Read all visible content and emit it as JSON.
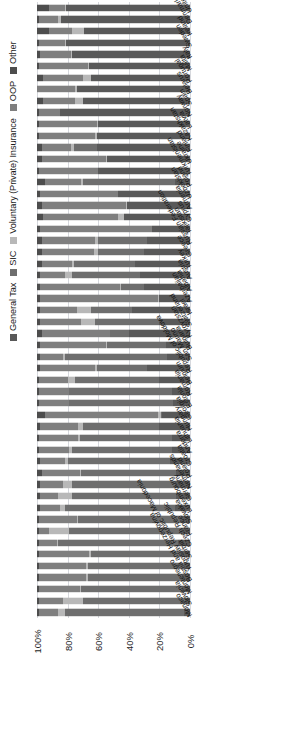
{
  "chart": {
    "type": "bar",
    "title": "",
    "xlabel": "",
    "ylabel": "",
    "orientation": "horizontal-stacked",
    "axis_reversed": true,
    "grid": true,
    "legend_position": "left-rotated"
  },
  "legend": {
    "items": [
      {
        "label": "General Tax",
        "color": "#595959",
        "icon": "square-swatch-icon"
      },
      {
        "label": "SIC",
        "color": "#6e6e6e",
        "icon": "square-swatch-icon"
      },
      {
        "label": "Voluntary (Private) Insurance",
        "color": "#b8b8b8",
        "icon": "square-swatch-icon"
      },
      {
        "label": "OOP",
        "color": "#7f7f7f",
        "icon": "square-swatch-icon"
      },
      {
        "label": "Other",
        "color": "#4d4d4d",
        "icon": "square-swatch-icon"
      }
    ]
  },
  "xaxis": {
    "ticks": [
      "100%",
      "80%",
      "60%",
      "40%",
      "20%",
      "0%"
    ],
    "tick_values": [
      100,
      80,
      60,
      40,
      20,
      0
    ],
    "min": 0,
    "max": 100
  },
  "chart_data": {
    "type": "bar",
    "subtype": "stacked-horizontal-100percent",
    "title": "",
    "xlabel": "",
    "ylabel": "",
    "xlim": [
      0,
      100
    ],
    "grid": true,
    "legend_position": "left",
    "series": [
      {
        "name": "General Tax",
        "color": "#595959"
      },
      {
        "name": "SIC",
        "color": "#6e6e6e"
      },
      {
        "name": "Voluntary (Private) Insurance",
        "color": "#b8b8b8"
      },
      {
        "name": "OOP",
        "color": "#7f7f7f"
      },
      {
        "name": "Other",
        "color": "#4d4d4d"
      }
    ],
    "categories": [
      "United Kingdom",
      "Denmark",
      "Ireland",
      "Sweden",
      "Italy",
      "Malta",
      "Portugal",
      "Belarus",
      "Spain",
      "Norway",
      "Latvia",
      "Kazakhstan",
      "Finland",
      "Ukraine",
      "Turkmenistan",
      "Poland",
      "Uzbekistan",
      "Armenia",
      "Cyprus",
      "Tajikistan",
      "Russian Federation",
      "Greece",
      "Turkey",
      "Austria",
      "Albania",
      "Azerbaijan",
      "Israel",
      "Switzerland",
      "Kyrgyzstan",
      "Bulgaria",
      "San Marino",
      "Republic of Moldova",
      "Belgium",
      "Romania",
      "Estonia",
      "Georgia",
      "Hungary",
      "Lithuania",
      "Andorra",
      "Croatia",
      "Poland",
      "Netherlands",
      "Germany",
      "Luxembourg",
      "Slovakia",
      "France",
      "Czech Republic",
      "Serbia",
      "Yugoslav Republic of Macedonia",
      "Bosnia and Herzegovina",
      "Montenegro",
      "Slovenia",
      "Monaco"
    ],
    "rows": [
      {
        "category": "United Kingdom",
        "values": [
          81,
          0,
          1,
          10,
          8
        ]
      },
      {
        "category": "Denmark",
        "values": [
          84,
          0,
          2,
          13,
          1
        ]
      },
      {
        "category": "Ireland",
        "values": [
          69,
          0,
          8,
          15,
          8
        ]
      },
      {
        "category": "Sweden",
        "values": [
          81,
          0,
          1,
          17,
          1
        ]
      },
      {
        "category": "Italy",
        "values": [
          77,
          0,
          1,
          20,
          2
        ]
      },
      {
        "category": "Malta",
        "values": [
          66,
          0,
          1,
          32,
          1
        ]
      },
      {
        "category": "Portugal",
        "values": [
          65,
          0,
          5,
          26,
          4
        ]
      },
      {
        "category": "Belarus",
        "values": [
          74,
          0,
          1,
          25,
          0
        ]
      },
      {
        "category": "Spain",
        "values": [
          70,
          0,
          5,
          21,
          4
        ]
      },
      {
        "category": "Norway",
        "values": [
          85,
          0,
          0,
          14,
          1
        ]
      },
      {
        "category": "Latvia",
        "values": [
          60,
          0,
          1,
          38,
          1
        ]
      },
      {
        "category": "Kazakhstan",
        "values": [
          61,
          0,
          1,
          37,
          1
        ]
      },
      {
        "category": "Finland",
        "values": [
          61,
          15,
          2,
          19,
          3
        ]
      },
      {
        "category": "Ukraine",
        "values": [
          54,
          0,
          1,
          42,
          3
        ]
      },
      {
        "category": "Turkmenistan",
        "values": [
          60,
          0,
          0,
          39,
          1
        ]
      },
      {
        "category": "Poland",
        "values": [
          10,
          60,
          1,
          24,
          5
        ]
      },
      {
        "category": "Uzbekistan",
        "values": [
          47,
          0,
          0,
          51,
          2
        ]
      },
      {
        "category": "Armenia",
        "values": [
          41,
          0,
          1,
          55,
          3
        ]
      },
      {
        "category": "Cyprus",
        "values": [
          43,
          0,
          4,
          49,
          4
        ]
      },
      {
        "category": "Tajikistan",
        "values": [
          25,
          0,
          0,
          73,
          2
        ]
      },
      {
        "category": "Russian Federation",
        "values": [
          28,
          32,
          2,
          35,
          3
        ]
      },
      {
        "category": "Greece",
        "values": [
          30,
          30,
          3,
          34,
          3
        ]
      },
      {
        "category": "Turkey",
        "values": [
          36,
          40,
          1,
          20,
          3
        ]
      },
      {
        "category": "Austria",
        "values": [
          33,
          44,
          5,
          16,
          2
        ]
      },
      {
        "category": "Albania",
        "values": [
          30,
          15,
          1,
          52,
          2
        ]
      },
      {
        "category": "Azerbaijan",
        "values": [
          20,
          0,
          1,
          77,
          2
        ]
      },
      {
        "category": "Israel",
        "values": [
          38,
          27,
          9,
          24,
          2
        ]
      },
      {
        "category": "Switzerland",
        "values": [
          20,
          42,
          9,
          27,
          2
        ]
      },
      {
        "category": "Kyrgyzstan",
        "values": [
          40,
          12,
          0,
          45,
          3
        ]
      },
      {
        "category": "Bulgaria",
        "values": [
          16,
          38,
          1,
          43,
          2
        ]
      },
      {
        "category": "San Marino",
        "values": [
          15,
          67,
          1,
          15,
          2
        ]
      },
      {
        "category": "Republic of Moldova",
        "values": [
          28,
          33,
          1,
          36,
          2
        ]
      },
      {
        "category": "Belgium",
        "values": [
          20,
          55,
          5,
          19,
          1
        ]
      },
      {
        "category": "Romania",
        "values": [
          12,
          67,
          0,
          20,
          1
        ]
      },
      {
        "category": "Estonia",
        "values": [
          11,
          68,
          0,
          20,
          1
        ]
      },
      {
        "category": "Georgia",
        "values": [
          18,
          1,
          2,
          74,
          5
        ]
      },
      {
        "category": "Hungary",
        "values": [
          20,
          50,
          3,
          25,
          2
        ]
      },
      {
        "category": "Lithuania",
        "values": [
          12,
          60,
          1,
          26,
          1
        ]
      },
      {
        "category": "Andorra",
        "values": [
          12,
          65,
          2,
          20,
          1
        ]
      },
      {
        "category": "Croatia",
        "values": [
          13,
          67,
          2,
          16,
          2
        ]
      },
      {
        "category": "Poland",
        "values": [
          9,
          62,
          1,
          25,
          3
        ]
      },
      {
        "category": "Netherlands",
        "values": [
          10,
          67,
          6,
          15,
          2
        ]
      },
      {
        "category": "Germany",
        "values": [
          9,
          68,
          9,
          12,
          2
        ]
      },
      {
        "category": "Luxembourg",
        "values": [
          10,
          72,
          3,
          13,
          2
        ]
      },
      {
        "category": "Slovakia",
        "values": [
          6,
          67,
          1,
          25,
          1
        ]
      },
      {
        "category": "France",
        "values": [
          6,
          73,
          13,
          7,
          1
        ]
      },
      {
        "category": "Czech Republic",
        "values": [
          8,
          78,
          1,
          12,
          1
        ]
      },
      {
        "category": "Serbia",
        "values": [
          5,
          60,
          1,
          33,
          1
        ]
      },
      {
        "category": "Yugoslav Republic of Macedonia",
        "values": [
          4,
          63,
          1,
          31,
          1
        ]
      },
      {
        "category": "Bosnia and Herzegovina",
        "values": [
          5,
          62,
          1,
          31,
          1
        ]
      },
      {
        "category": "Montenegro",
        "values": [
          5,
          66,
          1,
          27,
          1
        ]
      },
      {
        "category": "Slovenia",
        "values": [
          3,
          67,
          13,
          16,
          1
        ]
      },
      {
        "category": "Monaco",
        "values": [
          4,
          78,
          4,
          13,
          1
        ]
      }
    ]
  }
}
